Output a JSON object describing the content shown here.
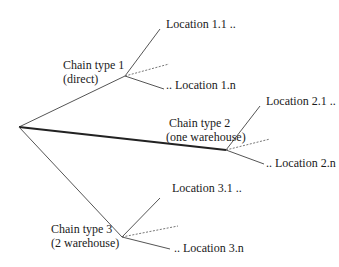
{
  "diagram": {
    "root": {
      "x": 19,
      "y": 127
    },
    "chains": [
      {
        "label_line1": "Chain type 1",
        "label_line2": "(direct)",
        "node": {
          "x": 125,
          "y": 76
        },
        "edge_style": "thin",
        "first_location": "Location 1.1 ..",
        "last_location": ".. Location 1.n",
        "first_end": {
          "x": 160,
          "y": 29
        },
        "dotted_end": {
          "x": 169,
          "y": 64
        },
        "last_end": {
          "x": 164,
          "y": 89
        }
      },
      {
        "label_line1": "Chain type 2",
        "label_line2": "(one warehouse)",
        "node": {
          "x": 226,
          "y": 150
        },
        "edge_style": "thick",
        "first_location": "Location 2.1 ..",
        "last_location": ".. Location 2.n",
        "first_end": {
          "x": 260,
          "y": 106
        },
        "dotted_end": {
          "x": 270,
          "y": 139
        },
        "last_end": {
          "x": 264,
          "y": 164
        }
      },
      {
        "label_line1": "Chain type 3",
        "label_line2": "(2 warehouse)",
        "node": {
          "x": 122,
          "y": 237
        },
        "edge_style": "thin",
        "first_location": "Location 3.1 ..",
        "last_location": ".. Location 3.n",
        "first_end": {
          "x": 160,
          "y": 198
        },
        "dotted_end": {
          "x": 178,
          "y": 226
        },
        "last_end": {
          "x": 170,
          "y": 249
        }
      }
    ]
  },
  "colors": {
    "line": "#555555",
    "thick_line": "#222222",
    "text": "#1a1a1a"
  }
}
